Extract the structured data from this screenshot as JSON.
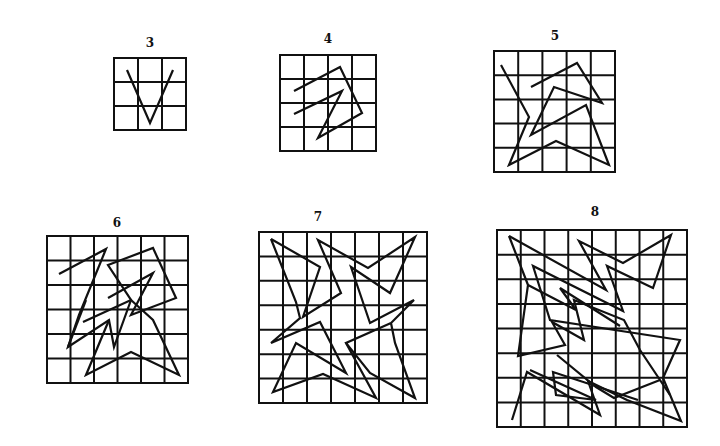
{
  "figure": {
    "background": "#ffffff",
    "ink": "#111111",
    "panels": [
      {
        "label": "3",
        "label_pos": [
          150,
          47
        ],
        "box": [
          114,
          58,
          72,
          72
        ],
        "n": 3,
        "paths": [
          [
            [
              127,
              70
            ],
            [
              150,
              123
            ],
            [
              173,
              70
            ]
          ]
        ]
      },
      {
        "label": "4",
        "label_pos": [
          328,
          43
        ],
        "box": [
          280,
          55,
          96,
          96
        ],
        "n": 4,
        "paths": [
          [
            [
              294,
              91
            ],
            [
              340,
              67
            ],
            [
              362,
              113
            ],
            [
              318,
              138
            ],
            [
              342,
              91
            ],
            [
              294,
              114
            ]
          ]
        ]
      },
      {
        "label": "5",
        "label_pos": [
          555,
          40
        ],
        "box": [
          494,
          51,
          121,
          121
        ],
        "n": 5,
        "paths": [
          [
            [
              531,
              87
            ],
            [
              577,
              63
            ],
            [
              602,
              103
            ],
            [
              554,
              87
            ],
            [
              531,
              135
            ],
            [
              586,
              105
            ],
            [
              609,
              165
            ],
            [
              556,
              141
            ],
            [
              509,
              165
            ],
            [
              529,
              117
            ],
            [
              501,
              65
            ]
          ]
        ]
      },
      {
        "label": "6",
        "label_pos": [
          117,
          227
        ],
        "box": [
          47,
          236,
          141,
          147
        ],
        "n": 6,
        "paths": [
          [
            [
              59,
              274
            ],
            [
              106,
              249
            ],
            [
              79,
              315
            ],
            [
              68,
              347
            ],
            [
              109,
              320
            ],
            [
              114,
              347
            ],
            [
              131,
              300
            ],
            [
              108,
              265
            ],
            [
              153,
              248
            ],
            [
              176,
              298
            ],
            [
              131,
              315
            ],
            [
              153,
              273
            ],
            [
              108,
              298
            ]
          ],
          [
            [
              68,
              347
            ],
            [
              86,
              300
            ]
          ],
          [
            [
              83,
              322
            ],
            [
              131,
              300
            ],
            [
              153,
              320
            ],
            [
              179,
              375
            ],
            [
              131,
              352
            ],
            [
              86,
              375
            ],
            [
              109,
              320
            ]
          ]
        ]
      },
      {
        "label": "7",
        "label_pos": [
          318,
          221
        ],
        "box": [
          259,
          232,
          168,
          171
        ],
        "n": 7,
        "paths": [
          [
            [
              271,
              239
            ],
            [
              320,
              267
            ],
            [
              303,
              317
            ],
            [
              341,
              293
            ],
            [
              318,
              240
            ],
            [
              368,
              268
            ],
            [
              415,
              237
            ],
            [
              390,
              293
            ],
            [
              351,
              267
            ],
            [
              370,
              323
            ],
            [
              414,
              300
            ],
            [
              391,
              323
            ],
            [
              395,
              343
            ],
            [
              415,
              398
            ],
            [
              370,
              373
            ],
            [
              346,
              343
            ],
            [
              391,
              323
            ]
          ],
          [
            [
              271,
              239
            ],
            [
              296,
              302
            ],
            [
              300,
              318
            ],
            [
              271,
              343
            ],
            [
              320,
              322
            ],
            [
              346,
              373
            ],
            [
              296,
              343
            ],
            [
              273,
              392
            ],
            [
              323,
              374
            ],
            [
              376,
              398
            ],
            [
              346,
              343
            ]
          ]
        ]
      },
      {
        "label": "8",
        "label_pos": [
          595,
          216
        ],
        "box": [
          497,
          230,
          190,
          197
        ],
        "n": 8,
        "paths": [
          [
            [
              509,
              236
            ],
            [
              606,
              290
            ],
            [
              579,
              241
            ],
            [
              623,
              263
            ],
            [
              671,
              235
            ],
            [
              653,
              288
            ],
            [
              607,
              266
            ],
            [
              623,
              311
            ],
            [
              533,
              266
            ],
            [
              550,
              320
            ],
            [
              680,
              340
            ],
            [
              663,
              378
            ],
            [
              681,
              421
            ],
            [
              627,
              400
            ],
            [
              588,
              381
            ],
            [
              600,
              415
            ],
            [
              527,
              372
            ],
            [
              512,
              420
            ]
          ],
          [
            [
              509,
              236
            ],
            [
              528,
              285
            ],
            [
              518,
              356
            ],
            [
              565,
              345
            ],
            [
              552,
              322
            ],
            [
              584,
              340
            ],
            [
              574,
              300
            ],
            [
              624,
              320
            ],
            [
              640,
              350
            ],
            [
              670,
              395
            ]
          ],
          [
            [
              528,
              285
            ],
            [
              576,
              310
            ],
            [
              560,
              288
            ],
            [
              620,
              326
            ]
          ],
          [
            [
              530,
              370
            ],
            [
              596,
              400
            ],
            [
              556,
              395
            ],
            [
              553,
              372
            ],
            [
              638,
              400
            ]
          ],
          [
            [
              557,
              355
            ],
            [
              596,
              387
            ],
            [
              614,
              398
            ],
            [
              660,
              380
            ]
          ]
        ]
      }
    ]
  }
}
